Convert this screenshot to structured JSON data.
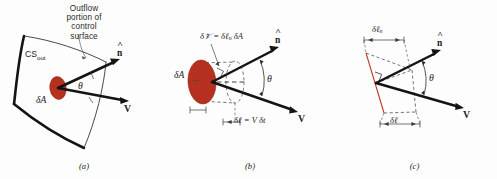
{
  "figure": {
    "background_color": "#fdfdfd",
    "surface_fill_color": "#b5301e",
    "stroke_color": "#1a1a1a",
    "dashed_color": "#4a4a4a",
    "red_line_color": "#c0392b"
  },
  "panel_a": {
    "caption": "(a)",
    "callout_line1": "Outflow",
    "callout_line2": "portion of",
    "callout_line3": "control",
    "callout_line4": "surface",
    "cs_label": "CS",
    "cs_subscript": "out",
    "area_label": "δA",
    "angle_label": "θ",
    "normal_label": "n",
    "velocity_label": "V"
  },
  "panel_b": {
    "caption": "(b)",
    "volume_equation": "δ𝒱 = δℓ",
    "volume_equation_sub": "n",
    "volume_equation_tail": "δA",
    "area_label": "δA",
    "angle_label": "θ",
    "normal_label": "n",
    "velocity_label": "V",
    "length_equation": "δℓ = V δt"
  },
  "panel_c": {
    "caption": "(c)",
    "normal_length_label": "δℓ",
    "normal_length_sub": "n",
    "length_label": "δℓ",
    "angle_label": "θ",
    "normal_label": "n",
    "velocity_label": "V"
  }
}
